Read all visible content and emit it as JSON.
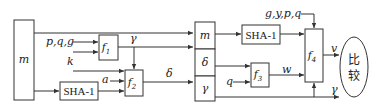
{
  "diagram": {
    "type": "signature-verification-flow",
    "nodes": {
      "message": {
        "label": "m"
      },
      "f1": {
        "label": "f",
        "sub": "1"
      },
      "f2": {
        "label": "f",
        "sub": "2"
      },
      "f3": {
        "label": "f",
        "sub": "3"
      },
      "f4": {
        "label": "f",
        "sub": "4"
      },
      "sha_left": {
        "label": "SHA-1"
      },
      "sha_right": {
        "label": "SHA-1"
      },
      "col_m": {
        "label": "m"
      },
      "col_delta": {
        "label": "δ"
      },
      "col_gamma": {
        "label": "γ"
      },
      "compare": {
        "label_top": "比",
        "label_bottom": "较"
      }
    },
    "edge_labels": {
      "pqg": "p,q,g",
      "k": "k",
      "gamma_f1": "γ",
      "a": "a",
      "delta": "δ",
      "gypq": "g,y,p,q",
      "q": "q",
      "w": "w",
      "v": "v",
      "gamma_out": "γ"
    }
  }
}
